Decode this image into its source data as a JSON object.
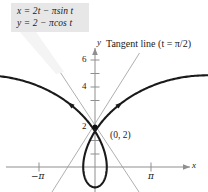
{
  "figure": {
    "name": "parametric-prolate-cycloid-with-tangent",
    "background": "#ffffff",
    "width": 208,
    "height": 192
  },
  "equation_box": {
    "background": "#e7e7e7",
    "line1": {
      "lhs": "x",
      "eq": "=",
      "rhs_a": "2t",
      "minus": "−",
      "pi": "π",
      "fn": "sin",
      "var": "t",
      "full": "x = 2t − πsin t"
    },
    "line2": {
      "lhs": "y",
      "eq": "=",
      "rhs_a": "2",
      "minus": "−",
      "pi": "π",
      "fn": "cos",
      "var": "t",
      "full": "y = 2 − πcos t"
    }
  },
  "annotations": {
    "tangent_label_text": "Tangent line (",
    "tangent_label_var": "t",
    "tangent_label_eq": " = ",
    "tangent_label_pi": "π",
    "tangent_label_tail": "/2)",
    "tangent_label_full": "Tangent line (t = π/2)",
    "point_label": "(0, 2)"
  },
  "axes": {
    "x_axis_label": "x",
    "y_axis_label": "y",
    "x_ticks": [
      {
        "label": "−π",
        "value": -3.14159,
        "px": 39
      },
      {
        "label": "π",
        "value": 3.14159,
        "px": 151
      }
    ],
    "y_ticks": [
      {
        "label": "6",
        "value": 6,
        "px": 60
      },
      {
        "label": "",
        "value": 5,
        "px": 73.5
      },
      {
        "label": "4",
        "value": 4,
        "px": 87
      },
      {
        "label": "",
        "value": 3,
        "px": 100.5
      },
      {
        "label": "2",
        "value": 2,
        "px": 127
      },
      {
        "label": "",
        "value": 1,
        "px": 154
      }
    ],
    "origin_px": {
      "x": 95,
      "y": 167
    },
    "x_range": [
      -5.6,
      6.4
    ],
    "y_range": [
      -1.5,
      8.8
    ]
  },
  "chart_data": {
    "type": "line",
    "title": "",
    "xlabel": "x",
    "ylabel": "y",
    "xlim": [
      -5.6,
      6.4
    ],
    "ylim": [
      -1.5,
      8.8
    ],
    "grid": false,
    "legend": "none",
    "series": [
      {
        "name": "prolate cycloid",
        "parametric": true,
        "x_expr": "2t - pi*sin(t)",
        "y_expr": "2 - pi*cos(t)",
        "t_range": [
          -3.4,
          3.4
        ],
        "color": "#1a1a1a",
        "linewidth": 2.1,
        "arrow_markers": [
          {
            "t": -2.05,
            "direction": "decreasing-t"
          },
          {
            "t": 2.05,
            "direction": "increasing-t"
          }
        ]
      },
      {
        "name": "tangent line right (t = pi/2)",
        "type": "line",
        "slope": 1.5708,
        "through": [
          0,
          2
        ],
        "color": "#9a9a9a",
        "linewidth": 0.8
      },
      {
        "name": "tangent line left (t = -pi/2)",
        "type": "line",
        "slope": -1.5708,
        "through": [
          0,
          2
        ],
        "color": "#9a9a9a",
        "linewidth": 0.8
      }
    ],
    "points": [
      {
        "label": "(0, 2)",
        "x": 0,
        "y": 2,
        "marker": "dot",
        "color": "#111111"
      }
    ],
    "annotations": [
      {
        "text": "x = 2t − πsin t",
        "type": "callout"
      },
      {
        "text": "y = 2 − πcos t",
        "type": "callout"
      },
      {
        "text": "Tangent line (t = π/2)",
        "type": "label"
      },
      {
        "text": "(0, 2)",
        "type": "point-label"
      }
    ]
  },
  "colors": {
    "curve": "#1a1a1a",
    "tangent": "#9a9a9a",
    "axis": "#8f8f8f",
    "text": "#1a1a1a",
    "box_bg": "#e7e7e7",
    "callout_leader": "#f2f2f2"
  }
}
